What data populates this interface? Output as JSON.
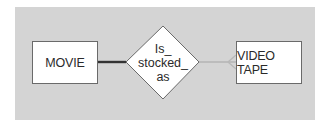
{
  "diagram": {
    "type": "entity-relationship",
    "entities": [
      {
        "id": "movie",
        "label": "MOVIE"
      },
      {
        "id": "video_tape",
        "label": "VIDEO TAPE"
      }
    ],
    "relationship": {
      "label_lines": [
        "Is_",
        "stocked_",
        "as"
      ],
      "from": "movie",
      "to": "video_tape",
      "from_connector": "thick-dark-line",
      "to_connector": "light-line-crows-foot"
    },
    "colors": {
      "panel_bg": "#d4d4d4",
      "shape_fill": "#ffffff",
      "thick_line": "#333333",
      "light_line": "#b4b4b4"
    }
  }
}
